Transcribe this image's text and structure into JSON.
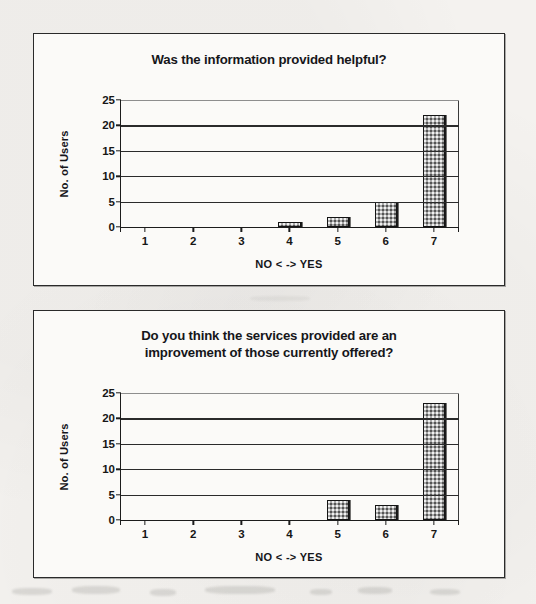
{
  "document": {
    "type": "scanned-survey-results",
    "background_color": "#f3f1ee"
  },
  "charts": [
    {
      "id": "chart-1",
      "title": "Was the information provided helpful?",
      "ylabel": "No. of Users",
      "xlabel": "NO < -> YES"
    },
    {
      "id": "chart-2",
      "title_line_1": "Do you think the services provided are an",
      "title_line_2": "improvement of those currently offered?",
      "title": "Do you think the services provided are an improvement of those currently offered?",
      "ylabel": "No. of Users",
      "xlabel": "NO < -> YES"
    }
  ],
  "chart_data": [
    {
      "type": "bar",
      "title": "Was the information provided helpful?",
      "xlabel": "NO < -> YES",
      "ylabel": "No. of Users",
      "categories": [
        "1",
        "2",
        "3",
        "4",
        "5",
        "6",
        "7"
      ],
      "values": [
        0,
        0,
        0,
        1,
        2,
        5,
        22
      ],
      "ylim": [
        0,
        25
      ],
      "yticks": [
        0,
        5,
        10,
        15,
        20,
        25
      ],
      "grid": true,
      "legend": "none",
      "bar_color": "#a9a9a9",
      "bar_border_color": "#141414"
    },
    {
      "type": "bar",
      "title": "Do you think the services provided are an improvement of those currently offered?",
      "xlabel": "NO < -> YES",
      "ylabel": "No. of Users",
      "categories": [
        "1",
        "2",
        "3",
        "4",
        "5",
        "6",
        "7"
      ],
      "values": [
        0,
        0,
        0,
        0,
        4,
        3,
        23
      ],
      "ylim": [
        0,
        25
      ],
      "yticks": [
        0,
        5,
        10,
        15,
        20,
        25
      ],
      "grid": true,
      "legend": "none",
      "bar_color": "#a9a9a9",
      "bar_border_color": "#141414"
    }
  ]
}
